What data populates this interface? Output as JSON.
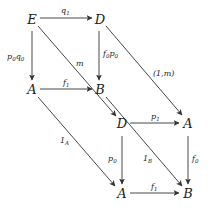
{
  "diagram": {
    "type": "commutative-diagram",
    "nodes": [
      {
        "id": "E",
        "label": "E",
        "x": 32,
        "y": 20
      },
      {
        "id": "D1",
        "label": "D",
        "x": 100,
        "y": 20
      },
      {
        "id": "A1",
        "label": "A",
        "x": 32,
        "y": 90
      },
      {
        "id": "B1",
        "label": "B",
        "x": 100,
        "y": 90
      },
      {
        "id": "D2",
        "label": "D",
        "x": 122,
        "y": 124
      },
      {
        "id": "A2",
        "label": "A",
        "x": 188,
        "y": 124
      },
      {
        "id": "A3",
        "label": "A",
        "x": 122,
        "y": 194
      },
      {
        "id": "B2",
        "label": "B",
        "x": 188,
        "y": 194
      }
    ],
    "edges": [
      {
        "from": "E",
        "to": "D1",
        "label": "q",
        "sub": "1"
      },
      {
        "from": "E",
        "to": "A1",
        "label": "p₀q₀"
      },
      {
        "from": "D1",
        "to": "B1",
        "label": "f₀p₀"
      },
      {
        "from": "A1",
        "to": "B1",
        "label": "f",
        "sub": "1"
      },
      {
        "from": "E",
        "to": "D2",
        "label": "m"
      },
      {
        "from": "D1",
        "to": "A2",
        "label": "(1,m)"
      },
      {
        "from": "A1",
        "to": "A3",
        "label": "1",
        "sub": "A"
      },
      {
        "from": "B1",
        "to": "B2",
        "label": "1",
        "sub": "B"
      },
      {
        "from": "D2",
        "to": "A2",
        "label": "p",
        "sub": "1"
      },
      {
        "from": "D2",
        "to": "A3",
        "label": "p",
        "sub": "0"
      },
      {
        "from": "A2",
        "to": "B2",
        "label": "f",
        "sub": "0"
      },
      {
        "from": "A3",
        "to": "B2",
        "label": "f",
        "sub": "1"
      }
    ]
  },
  "labels": {
    "E": "E",
    "D": "D",
    "A": "A",
    "B": "B",
    "q": "q",
    "p": "p",
    "f": "f",
    "m": "m",
    "one": "1",
    "s0": "0",
    "s1": "1",
    "sA": "A",
    "sB": "B",
    "p0q0_p": "p",
    "p0q0_q": "q",
    "f0p0_f": "f",
    "f0p0_p": "p",
    "one_m": "(1,m)"
  }
}
